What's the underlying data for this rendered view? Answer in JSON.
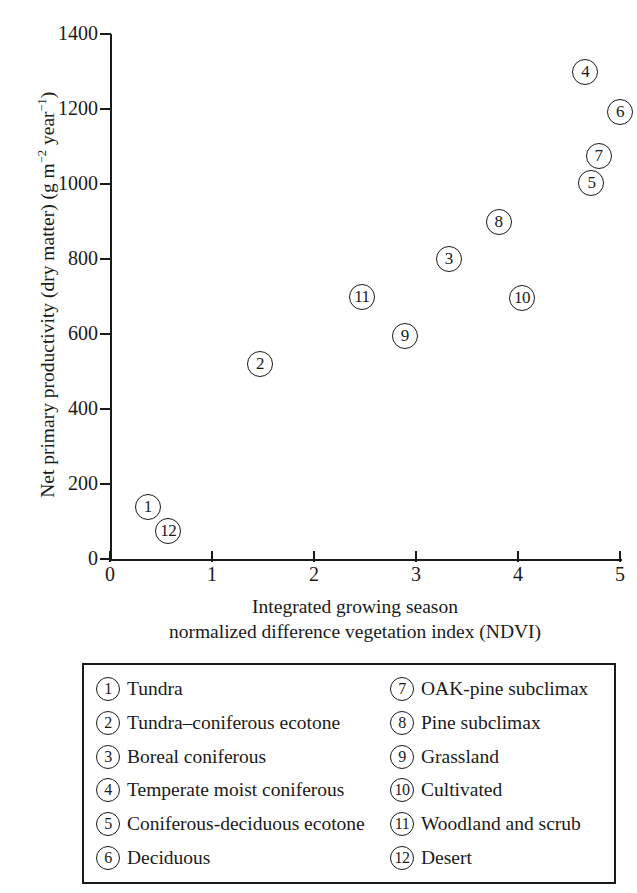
{
  "chart_data": {
    "type": "scatter",
    "title": "",
    "xlabel": "Integrated growing season normalized difference vegetation index (NDVI)",
    "xlabel_line1": "Integrated growing season",
    "xlabel_line2": "normalized difference vegetation index (NDVI)",
    "ylabel": "Net primary productivity (dry matter) (g m−2 year−1)",
    "ylabel_parts": {
      "before": "Net primary productivity (dry matter) (g m",
      "sup1": "−2",
      "middle": " year",
      "sup2": "−1",
      "after": ")"
    },
    "xlim": [
      0,
      5
    ],
    "ylim": [
      0,
      1400
    ],
    "xticks": [
      "0",
      "1",
      "2",
      "3",
      "4",
      "5"
    ],
    "yticks": [
      "0",
      "200",
      "400",
      "600",
      "800",
      "1000",
      "1200",
      "1400"
    ],
    "grid": false,
    "legend_position": "below-plot",
    "marker_style": "numbered-circle",
    "points": [
      {
        "id": "1",
        "label": "Tundra",
        "x": 0.37,
        "y": 140
      },
      {
        "id": "2",
        "label": "Tundra–coniferous ecotone",
        "x": 1.47,
        "y": 520
      },
      {
        "id": "3",
        "label": "Boreal coniferous",
        "x": 3.32,
        "y": 800
      },
      {
        "id": "4",
        "label": "Temperate moist coniferous",
        "x": 4.66,
        "y": 1300
      },
      {
        "id": "5",
        "label": "Coniferous-deciduous ecotone",
        "x": 4.72,
        "y": 1002
      },
      {
        "id": "6",
        "label": "Deciduous",
        "x": 5.0,
        "y": 1192
      },
      {
        "id": "7",
        "label": "OAK-pine subclimax",
        "x": 4.79,
        "y": 1075
      },
      {
        "id": "8",
        "label": "Pine subclimax",
        "x": 3.81,
        "y": 898
      },
      {
        "id": "9",
        "label": "Grassland",
        "x": 2.89,
        "y": 595
      },
      {
        "id": "10",
        "label": "Cultivated",
        "x": 4.04,
        "y": 697
      },
      {
        "id": "11",
        "label": "Woodland and scrub",
        "x": 2.47,
        "y": 700
      },
      {
        "id": "12",
        "label": "Desert",
        "x": 0.57,
        "y": 75
      }
    ]
  },
  "legend": {
    "items": [
      {
        "id": "1",
        "label": "Tundra"
      },
      {
        "id": "2",
        "label": "Tundra–coniferous ecotone"
      },
      {
        "id": "3",
        "label": "Boreal coniferous"
      },
      {
        "id": "4",
        "label": "Temperate moist coniferous"
      },
      {
        "id": "5",
        "label": "Coniferous-deciduous ecotone"
      },
      {
        "id": "6",
        "label": "Deciduous"
      },
      {
        "id": "7",
        "label": "OAK-pine subclimax"
      },
      {
        "id": "8",
        "label": "Pine subclimax"
      },
      {
        "id": "9",
        "label": "Grassland"
      },
      {
        "id": "10",
        "label": "Cultivated"
      },
      {
        "id": "11",
        "label": "Woodland and scrub"
      },
      {
        "id": "12",
        "label": "Desert"
      }
    ]
  },
  "colors": {
    "ink": "#1a1a1a",
    "background": "#ffffff"
  }
}
